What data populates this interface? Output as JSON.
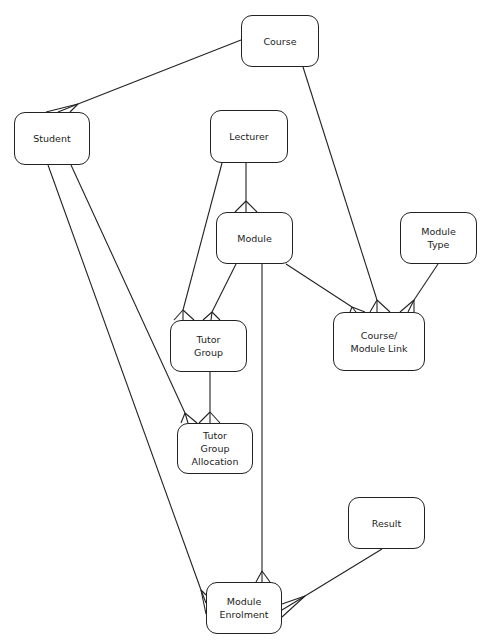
{
  "diagram": {
    "type": "entity-relationship",
    "entities": [
      {
        "id": "course",
        "label": "Course",
        "x": 241,
        "y": 15,
        "w": 78,
        "h": 52
      },
      {
        "id": "student",
        "label": "Student",
        "x": 14,
        "y": 112,
        "w": 76,
        "h": 53
      },
      {
        "id": "lecturer",
        "label": "Lecturer",
        "x": 210,
        "y": 110,
        "w": 78,
        "h": 53
      },
      {
        "id": "module",
        "label": "Module",
        "x": 216,
        "y": 212,
        "w": 77,
        "h": 52
      },
      {
        "id": "module-type",
        "label": "Module\nType",
        "x": 400,
        "y": 212,
        "w": 77,
        "h": 52
      },
      {
        "id": "tutor-group",
        "label": "Tutor\nGroup",
        "x": 170,
        "y": 320,
        "w": 77,
        "h": 52
      },
      {
        "id": "course-module-link",
        "label": "Course/\nModule Link",
        "x": 333,
        "y": 312,
        "w": 92,
        "h": 59
      },
      {
        "id": "tutor-group-allocation",
        "label": "Tutor\nGroup\nAllocation",
        "x": 177,
        "y": 423,
        "w": 76,
        "h": 51
      },
      {
        "id": "result",
        "label": "Result",
        "x": 348,
        "y": 497,
        "w": 77,
        "h": 52
      },
      {
        "id": "module-enrolment",
        "label": "Module\nEnrolment",
        "x": 206,
        "y": 582,
        "w": 76,
        "h": 52
      }
    ],
    "relationships": [
      {
        "from": "course",
        "to": "student",
        "cardinality": "one-to-many"
      },
      {
        "from": "course",
        "to": "course-module-link",
        "cardinality": "one-to-many"
      },
      {
        "from": "lecturer",
        "to": "module",
        "cardinality": "one-to-many"
      },
      {
        "from": "lecturer",
        "to": "tutor-group",
        "cardinality": "one-to-many"
      },
      {
        "from": "module",
        "to": "tutor-group",
        "cardinality": "one-to-many"
      },
      {
        "from": "module",
        "to": "course-module-link",
        "cardinality": "one-to-many"
      },
      {
        "from": "module-type",
        "to": "course-module-link",
        "cardinality": "one-to-many"
      },
      {
        "from": "module",
        "to": "module-enrolment",
        "cardinality": "one-to-many"
      },
      {
        "from": "tutor-group",
        "to": "tutor-group-allocation",
        "cardinality": "one-to-many"
      },
      {
        "from": "student",
        "to": "tutor-group-allocation",
        "cardinality": "one-to-many"
      },
      {
        "from": "student",
        "to": "module-enrolment",
        "cardinality": "one-to-many"
      },
      {
        "from": "result",
        "to": "module-enrolment",
        "cardinality": "one-to-many"
      }
    ]
  }
}
